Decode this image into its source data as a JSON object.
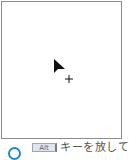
{
  "canvas": {
    "background": "#ffffff",
    "border_color": "#8c8c8c"
  },
  "pointer": {
    "icon": "arrow-cursor-icon",
    "modifier_icon": "plus-icon",
    "modifier_glyph": "+"
  },
  "caption": {
    "step_badge_icon": "step-number-icon",
    "step_badge_color": "#1e88d6",
    "key_label": "Alt",
    "text": "キーを放して"
  }
}
